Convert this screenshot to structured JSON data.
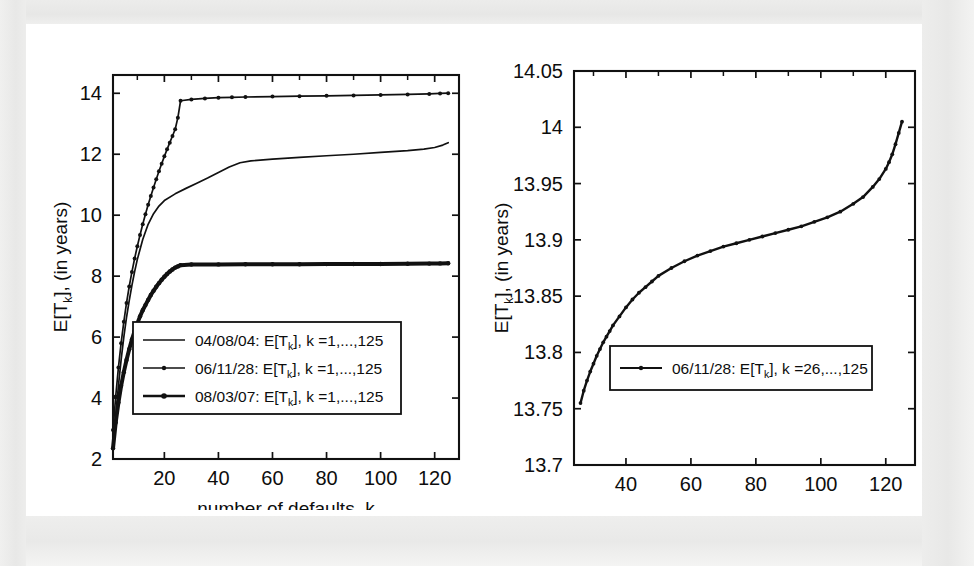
{
  "figure": {
    "background_color": "#ececeb",
    "plate_color": "#ffffff",
    "ink_color": "#111111"
  },
  "chart_data": [
    {
      "id": "left-panel",
      "type": "line",
      "title": "",
      "xlabel": "number of defaults, k",
      "ylabel": "E[T_k], (in years)",
      "ylabel_parts": {
        "prefix": "E[T",
        "sub": "k",
        "suffix": "], (in years)"
      },
      "xlim": [
        1,
        129
      ],
      "ylim": [
        2,
        14.6
      ],
      "xticks": [
        20,
        40,
        60,
        80,
        100,
        120
      ],
      "xticklabels": [
        "20",
        "40",
        "60",
        "80",
        "100",
        "120"
      ],
      "yticks": [
        2,
        4,
        6,
        8,
        10,
        12,
        14
      ],
      "yticklabels": [
        "2",
        "4",
        "6",
        "8",
        "10",
        "12",
        "14"
      ],
      "grid": false,
      "legend_position": "lower-center",
      "legend": [
        {
          "label": "04/08/04: E[T_k], k =1,...,125",
          "parts": {
            "a": "04/08/04: E[T",
            "sub": "k",
            "b": "], k =1,...,125"
          },
          "style": "line",
          "markers": false
        },
        {
          "label": "06/11/28: E[T_k], k =1,...,125",
          "parts": {
            "a": "06/11/28: E[T",
            "sub": "k",
            "b": "], k =1,...,125"
          },
          "style": "line-marker",
          "markers": true
        },
        {
          "label": "08/03/07: E[T_k], k =1,...,125",
          "parts": {
            "a": "08/03/07: E[T",
            "sub": "k",
            "b": "], k =1,...,125"
          },
          "style": "line-marker-bold",
          "markers": true
        }
      ],
      "series": [
        {
          "name": "06/11/28",
          "x": [
            1,
            2,
            3,
            4,
            5,
            6,
            7,
            8,
            9,
            10,
            11,
            12,
            13,
            14,
            15,
            16,
            17,
            18,
            19,
            20,
            21,
            22,
            23,
            24,
            25,
            26,
            30,
            35,
            40,
            45,
            50,
            60,
            70,
            80,
            90,
            100,
            110,
            118,
            122,
            125
          ],
          "values": [
            2.95,
            4.05,
            5.0,
            5.8,
            6.5,
            7.12,
            7.66,
            8.14,
            8.58,
            8.98,
            9.35,
            9.7,
            10.03,
            10.34,
            10.63,
            10.91,
            11.18,
            11.44,
            11.69,
            11.93,
            12.16,
            12.38,
            12.6,
            12.82,
            13.2,
            13.755,
            13.8,
            13.83,
            13.855,
            13.868,
            13.878,
            13.893,
            13.905,
            13.917,
            13.93,
            13.945,
            13.962,
            13.98,
            13.995,
            14.005
          ]
        },
        {
          "name": "04/08/04",
          "x": [
            1,
            2,
            3,
            4,
            5,
            6,
            7,
            8,
            9,
            10,
            12,
            14,
            16,
            18,
            20,
            24,
            28,
            32,
            36,
            40,
            44,
            48,
            52,
            60,
            70,
            80,
            90,
            100,
            110,
            116,
            120,
            123,
            125
          ],
          "values": [
            2.3,
            3.4,
            4.4,
            5.25,
            6.0,
            6.65,
            7.2,
            7.7,
            8.15,
            8.55,
            9.2,
            9.7,
            10.05,
            10.3,
            10.48,
            10.7,
            10.88,
            11.05,
            11.22,
            11.4,
            11.58,
            11.72,
            11.78,
            11.84,
            11.9,
            11.95,
            12.0,
            12.06,
            12.12,
            12.17,
            12.22,
            12.3,
            12.38
          ]
        },
        {
          "name": "08/03/07",
          "x": [
            1,
            2,
            3,
            4,
            5,
            6,
            7,
            8,
            9,
            10,
            11,
            12,
            13,
            14,
            15,
            16,
            17,
            18,
            19,
            20,
            21,
            22,
            23,
            24,
            25,
            26,
            30,
            40,
            50,
            60,
            70,
            80,
            90,
            100,
            110,
            118,
            122,
            125
          ],
          "values": [
            2.35,
            3.2,
            3.85,
            4.4,
            4.85,
            5.25,
            5.6,
            5.92,
            6.2,
            6.45,
            6.68,
            6.88,
            7.05,
            7.22,
            7.38,
            7.52,
            7.65,
            7.77,
            7.88,
            7.98,
            8.07,
            8.15,
            8.22,
            8.28,
            8.32,
            8.36,
            8.38,
            8.385,
            8.388,
            8.39,
            8.392,
            8.395,
            8.398,
            8.4,
            8.405,
            8.412,
            8.418,
            8.425
          ]
        }
      ]
    },
    {
      "id": "right-panel",
      "type": "line",
      "title": "",
      "xlabel": "number of defaults, k",
      "ylabel": "E[T_k], (in years)",
      "ylabel_parts": {
        "prefix": "E[T",
        "sub": "k",
        "suffix": "], (in years)"
      },
      "xlim": [
        24,
        129
      ],
      "ylim": [
        13.7,
        14.05
      ],
      "xticks": [
        40,
        60,
        80,
        100,
        120
      ],
      "xticklabels": [
        "40",
        "60",
        "80",
        "100",
        "120"
      ],
      "yticks": [
        13.7,
        13.75,
        13.8,
        13.85,
        13.9,
        13.95,
        14,
        14.05
      ],
      "yticklabels": [
        "13.7",
        "13.75",
        "13.8",
        "13.85",
        "13.9",
        "13.95",
        "14",
        "14.05"
      ],
      "grid": false,
      "legend_position": "lower-center",
      "legend": [
        {
          "label": "06/11/28: E[T_k], k =26,...,125",
          "parts": {
            "a": "06/11/28: E[T",
            "sub": "k",
            "b": "], k =26,...,125"
          },
          "style": "line-marker",
          "markers": true
        }
      ],
      "series": [
        {
          "name": "06/11/28",
          "x": [
            26,
            27,
            28,
            29,
            30,
            31,
            32,
            33,
            34,
            35,
            36,
            38,
            40,
            42,
            44,
            46,
            48,
            50,
            54,
            58,
            62,
            66,
            70,
            74,
            78,
            82,
            86,
            90,
            94,
            98,
            102,
            106,
            110,
            113,
            116,
            118,
            120,
            121,
            122,
            123,
            124,
            125
          ],
          "values": [
            13.755,
            13.766,
            13.775,
            13.783,
            13.79,
            13.797,
            13.803,
            13.809,
            13.814,
            13.819,
            13.824,
            13.832,
            13.84,
            13.847,
            13.853,
            13.858,
            13.863,
            13.868,
            13.875,
            13.881,
            13.886,
            13.89,
            13.894,
            13.897,
            13.9,
            13.903,
            13.906,
            13.909,
            13.912,
            13.916,
            13.92,
            13.925,
            13.932,
            13.938,
            13.947,
            13.954,
            13.963,
            13.969,
            13.976,
            13.985,
            13.995,
            14.005
          ]
        }
      ]
    }
  ]
}
